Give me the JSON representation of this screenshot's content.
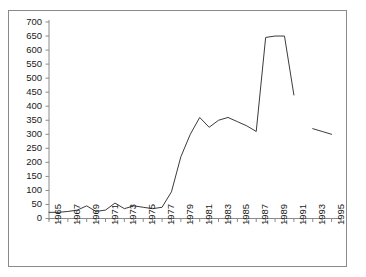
{
  "chart_data": {
    "type": "line",
    "title": "",
    "subtitle": "",
    "xlabel": "",
    "ylabel": "",
    "xlim": [
      1965,
      1996
    ],
    "ylim": [
      0,
      700
    ],
    "ytick_step": 50,
    "xtick_step": 1,
    "xlabel_step": 2,
    "grid": false,
    "legend": null,
    "legend_position": "none",
    "line_color": "#3b3b3b",
    "frame_color": "#8a8a8a",
    "background_color": "#ffffff",
    "yticks": [
      0,
      50,
      100,
      150,
      200,
      250,
      300,
      350,
      400,
      450,
      500,
      550,
      600,
      650,
      700
    ],
    "xticks": [
      1965,
      1966,
      1967,
      1968,
      1969,
      1970,
      1971,
      1972,
      1973,
      1974,
      1975,
      1976,
      1977,
      1978,
      1979,
      1980,
      1981,
      1982,
      1983,
      1984,
      1985,
      1986,
      1987,
      1988,
      1989,
      1990,
      1991,
      1992,
      1993,
      1994,
      1995,
      1996
    ],
    "xtick_labels": [
      "1965",
      "1967",
      "1969",
      "1971",
      "1973",
      "1975",
      "1977",
      "1979",
      "1981",
      "1983",
      "1985",
      "1987",
      "1989",
      "1991",
      "1993",
      "1995"
    ],
    "xtick_label_years": [
      1965,
      1967,
      1969,
      1971,
      1973,
      1975,
      1977,
      1979,
      1981,
      1983,
      1985,
      1987,
      1989,
      1991,
      1993,
      1995
    ],
    "series": [
      {
        "name": "main",
        "x": [
          1965,
          1966,
          1967,
          1968,
          1969,
          1970,
          1971,
          1972,
          1973,
          1974,
          1975,
          1976,
          1977,
          1978,
          1979,
          1980,
          1981,
          1982,
          1983,
          1984,
          1985,
          1986,
          1987,
          1988,
          1989,
          1990,
          1991
        ],
        "values": [
          22,
          22,
          25,
          30,
          45,
          25,
          30,
          55,
          35,
          45,
          40,
          35,
          40,
          95,
          220,
          300,
          360,
          325,
          350,
          360,
          345,
          330,
          310,
          645,
          650,
          650,
          440
        ]
      },
      {
        "name": "segment-2",
        "x": [
          1993,
          1994,
          1995
        ],
        "values": [
          320,
          310,
          300
        ]
      }
    ]
  }
}
